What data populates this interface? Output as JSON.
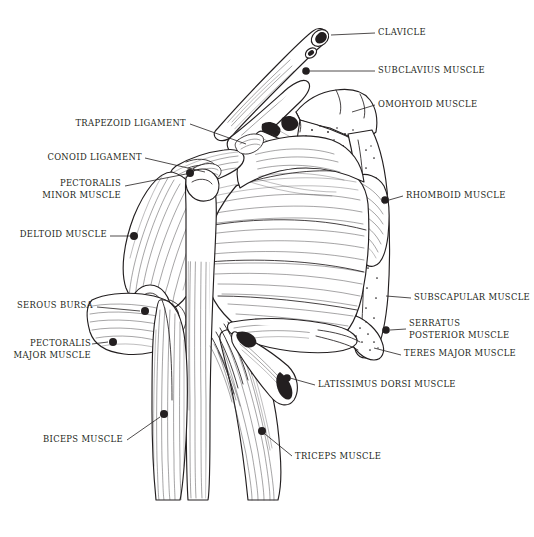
{
  "figure": {
    "background_color": "#ffffff",
    "ink_color": "#231f20",
    "width": 534,
    "height": 537
  },
  "labels": [
    {
      "id": "clavicle",
      "text": "CLAVICLE",
      "side": "right",
      "x": 378,
      "y": 27,
      "leader_from": [
        340,
        33
      ],
      "leader_to": [
        322,
        35
      ],
      "dot": [
        321,
        35
      ]
    },
    {
      "id": "subclavius",
      "text": "SUBCLAVIUS MUSCLE",
      "side": "right",
      "x": 378,
      "y": 65,
      "leader_from": [
        340,
        71
      ],
      "leader_to": [
        306,
        71
      ],
      "dot": [
        305,
        71
      ]
    },
    {
      "id": "omohyoid",
      "text": "OMOHYOID MUSCLE",
      "side": "right",
      "x": 378,
      "y": 99,
      "leader_from": [
        340,
        105
      ],
      "leader_to": [
        308,
        112
      ],
      "dot": null
    },
    {
      "id": "rhomboid",
      "text": "RHOMBOID MUSCLE",
      "side": "right",
      "x": 406,
      "y": 190,
      "leader_from": [
        400,
        196
      ],
      "leader_to": [
        385,
        200
      ],
      "dot": [
        384,
        200
      ]
    },
    {
      "id": "subscapular",
      "text": "SUBSCAPULAR MUSCLE",
      "side": "right",
      "x": 414,
      "y": 292,
      "leader_from": [
        408,
        298
      ],
      "leader_to": [
        386,
        298
      ],
      "dot": null
    },
    {
      "id": "serratus_posterior",
      "text": "SERRATUS\nPOSTERIOR MUSCLE",
      "side": "right",
      "x": 409,
      "y": 323,
      "leader_from": [
        403,
        335
      ],
      "leader_to": [
        385,
        330
      ],
      "dot": [
        384,
        330
      ]
    },
    {
      "id": "teres_major",
      "text": "TERES MAJOR MUSCLE",
      "side": "right",
      "x": 404,
      "y": 352,
      "leader_from": [
        398,
        357
      ],
      "leader_to": [
        380,
        350
      ],
      "dot": null
    },
    {
      "id": "latissimus_dorsi",
      "text": "LATISSIMUS DORSI MUSCLE",
      "side": "right",
      "x": 318,
      "y": 382,
      "leader_from": [
        312,
        387
      ],
      "leader_to": [
        285,
        378
      ],
      "dot": [
        284,
        378
      ]
    },
    {
      "id": "triceps",
      "text": "TRICEPS MUSCLE",
      "side": "right",
      "x": 295,
      "y": 454,
      "leader_from": [
        289,
        459
      ],
      "leader_to": [
        262,
        432
      ],
      "dot": [
        261,
        431
      ]
    },
    {
      "id": "trapezoid_ligament",
      "text": "TRAPEZOID LIGAMENT",
      "side": "left",
      "x": 186,
      "y": 119,
      "leader_from": [
        190,
        125
      ],
      "leader_to": [
        238,
        142
      ],
      "dot": null
    },
    {
      "id": "conoid_ligament",
      "text": "CONOID LIGAMENT",
      "side": "left",
      "x": 140,
      "y": 153,
      "leader_from": [
        144,
        159
      ],
      "leader_to": [
        194,
        173
      ],
      "dot": null
    },
    {
      "id": "pectoralis_minor",
      "text": "PECTORALIS\nMINOR MUSCLE",
      "side": "left",
      "x": 122,
      "y": 180,
      "leader_from": [
        120,
        186
      ],
      "leader_to": [
        190,
        173
      ],
      "dot": [
        190,
        173
      ]
    },
    {
      "id": "deltoid",
      "text": "DELTOID MUSCLE",
      "side": "left",
      "x": 106,
      "y": 230,
      "leader_from": [
        110,
        236
      ],
      "leader_to": [
        133,
        236
      ],
      "dot": [
        134,
        236
      ]
    },
    {
      "id": "serous_bursa",
      "text": "SEROUS BURSA",
      "side": "left",
      "x": 92,
      "y": 301,
      "leader_from": [
        96,
        307
      ],
      "leader_to": [
        143,
        311
      ],
      "dot": [
        144,
        311
      ]
    },
    {
      "id": "pectoralis_major",
      "text": "PECTORALIS\nMAJOR MUSCLE",
      "side": "left",
      "x": 94,
      "y": 340,
      "leader_from": [
        92,
        346
      ],
      "leader_to": [
        112,
        341
      ],
      "dot": [
        113,
        341
      ]
    },
    {
      "id": "biceps",
      "text": "BICEPS MUSCLE",
      "side": "left",
      "x": 122,
      "y": 435,
      "leader_from": [
        126,
        441
      ],
      "leader_to": [
        163,
        415
      ],
      "dot": [
        164,
        414
      ]
    }
  ],
  "structures": [
    {
      "id": "clavicle-bone",
      "name": "clavicle"
    },
    {
      "id": "subclavius-muscle",
      "name": "subclavius muscle"
    },
    {
      "id": "omohyoid-muscle",
      "name": "omohyoid muscle"
    },
    {
      "id": "scapula-bone",
      "name": "scapula"
    },
    {
      "id": "rhomboid-muscle",
      "name": "rhomboid muscle"
    },
    {
      "id": "subscapular-muscle",
      "name": "subscapular muscle"
    },
    {
      "id": "serratus-muscle",
      "name": "serratus posterior muscle"
    },
    {
      "id": "teres-major-muscle",
      "name": "teres major muscle"
    },
    {
      "id": "latissimus-muscle",
      "name": "latissimus dorsi muscle"
    },
    {
      "id": "deltoid-muscle",
      "name": "deltoid muscle"
    },
    {
      "id": "pectoralis-minor",
      "name": "pectoralis minor muscle"
    },
    {
      "id": "pectoralis-major",
      "name": "pectoralis major muscle"
    },
    {
      "id": "serous-bursa",
      "name": "serous bursa"
    },
    {
      "id": "humerus-bone",
      "name": "humerus"
    },
    {
      "id": "biceps-muscle",
      "name": "biceps muscle"
    },
    {
      "id": "triceps-muscle",
      "name": "triceps muscle"
    },
    {
      "id": "trapezoid-ligament",
      "name": "trapezoid ligament"
    },
    {
      "id": "conoid-ligament",
      "name": "conoid ligament"
    }
  ]
}
